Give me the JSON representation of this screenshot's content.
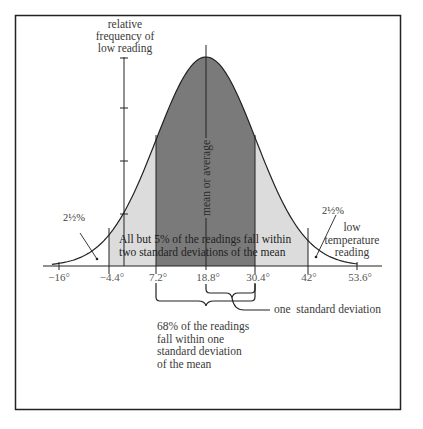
{
  "figure": {
    "y_axis_label": [
      "relative",
      "frequency of",
      "low reading"
    ],
    "x_axis_label": [
      "low",
      "temperature",
      "reading"
    ],
    "mean_label": "mean or average",
    "tail_left_pct": "2½%",
    "tail_right_pct": "2½%",
    "two_sd_caption": [
      "All but 5% of the readings fall within",
      "two standard deviations of the mean"
    ],
    "one_sd_caption": [
      "68% of the readings",
      "fall within one",
      "standard deviation",
      "of the mean"
    ],
    "one_sd_label": "one  standard deviation",
    "ticks": [
      "−16°",
      "−4.4°",
      "7.2°",
      "18.8°",
      "30.4°",
      "42°",
      "53.6°"
    ]
  },
  "colors": {
    "one_sd_fill": "#7a7a7a",
    "two_sd_fill": "#dcdcdc",
    "line": "#222222",
    "frame": "#222222"
  },
  "chart_data": {
    "type": "area",
    "xlabel": "low temperature reading",
    "ylabel": "relative frequency of low reading",
    "mean": 18.8,
    "standard_deviation": 11.6,
    "x_ticks": [
      -16,
      -4.4,
      7.2,
      18.8,
      30.4,
      42,
      53.6
    ],
    "regions": [
      {
        "name": "within one standard deviation",
        "range": [
          7.2,
          30.4
        ],
        "percent": 68,
        "fill": "#7a7a7a"
      },
      {
        "name": "within two standard deviations",
        "range": [
          -4.4,
          42
        ],
        "percent": 95,
        "fill": "#dcdcdc"
      },
      {
        "name": "left tail",
        "range": [
          -16,
          -4.4
        ],
        "percent": 2.5
      },
      {
        "name": "right tail",
        "range": [
          42,
          53.6
        ],
        "percent": 2.5
      }
    ],
    "annotations": [
      "mean or average",
      "All but 5% of the readings fall within two standard deviations of the mean",
      "68% of the readings fall within one standard deviation of the mean",
      "one standard deviation",
      "2½%",
      "2½%"
    ],
    "grid": false
  }
}
